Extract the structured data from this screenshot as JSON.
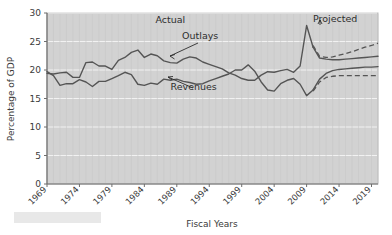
{
  "chart_data": {
    "type": "line",
    "title": "",
    "xlabel": "Fiscal Years",
    "ylabel": "Percentage of GDP",
    "xlim": [
      1969,
      2020
    ],
    "ylim": [
      0,
      30
    ],
    "grid": true,
    "legend_position": "inline-annotations",
    "x_tick_labels": [
      "1969",
      "1974",
      "1979",
      "1984",
      "1989",
      "1994",
      "1999",
      "2004",
      "2009",
      "2014",
      "2019"
    ],
    "y_tick_labels": [
      "0",
      "5",
      "10",
      "15",
      "20",
      "25",
      "30"
    ],
    "y_ticks": [
      0,
      5,
      10,
      15,
      20,
      25,
      30
    ],
    "annotations": [
      {
        "name": "actual-label",
        "text": "Actual",
        "x": 1988,
        "y": 28.2
      },
      {
        "name": "projected-label",
        "text": "Projected",
        "x": 2013.4,
        "y": 28.4
      },
      {
        "name": "outlays-label",
        "text": "Outlays",
        "x": 1992.6,
        "y": 25.4
      },
      {
        "name": "revenues-label",
        "text": "Revenues",
        "x": 1991.6,
        "y": 16.5
      }
    ],
    "series": [
      {
        "name": "Outlays",
        "style": "solid",
        "segment": "actual",
        "color": "#555555",
        "x": [
          1969,
          1970,
          1971,
          1972,
          1973,
          1974,
          1975,
          1976,
          1977,
          1978,
          1979,
          1980,
          1981,
          1982,
          1983,
          1984,
          1985,
          1986,
          1987,
          1988,
          1989,
          1990,
          1991,
          1992,
          1993,
          1994,
          1995,
          1996,
          1997,
          1998,
          1999,
          2000,
          2001,
          2002,
          2003,
          2004,
          2005,
          2006,
          2007,
          2008,
          2009,
          2010
        ],
        "values": [
          19.4,
          19.3,
          19.5,
          19.6,
          18.7,
          18.7,
          21.3,
          21.4,
          20.7,
          20.7,
          20.1,
          21.7,
          22.2,
          23.1,
          23.5,
          22.2,
          22.8,
          22.5,
          21.6,
          21.3,
          21.2,
          21.9,
          22.3,
          22.1,
          21.4,
          21.0,
          20.6,
          20.2,
          19.5,
          19.1,
          18.5,
          18.2,
          18.2,
          19.1,
          19.7,
          19.6,
          19.9,
          20.1,
          19.6,
          20.7,
          27.8,
          24.0
        ]
      },
      {
        "name": "Revenues",
        "style": "solid",
        "segment": "actual",
        "color": "#555555",
        "x": [
          1969,
          1970,
          1971,
          1972,
          1973,
          1974,
          1975,
          1976,
          1977,
          1978,
          1979,
          1980,
          1981,
          1982,
          1983,
          1984,
          1985,
          1986,
          1987,
          1988,
          1989,
          1990,
          1991,
          1992,
          1993,
          1994,
          1995,
          1996,
          1997,
          1998,
          1999,
          2000,
          2001,
          2002,
          2003,
          2004,
          2005,
          2006,
          2007,
          2008,
          2009,
          2010
        ],
        "values": [
          19.7,
          19.0,
          17.3,
          17.6,
          17.6,
          18.3,
          17.9,
          17.1,
          18.0,
          18.0,
          18.5,
          19.0,
          19.6,
          19.2,
          17.5,
          17.3,
          17.7,
          17.5,
          18.4,
          18.2,
          18.4,
          18.0,
          17.8,
          17.5,
          17.6,
          18.1,
          18.5,
          18.9,
          19.3,
          20.0,
          20.0,
          20.9,
          19.8,
          17.9,
          16.5,
          16.3,
          17.6,
          18.2,
          18.5,
          17.5,
          15.5,
          16.5
        ]
      },
      {
        "name": "Outlays (projected, baseline)",
        "style": "solid",
        "segment": "projected",
        "color": "#555555",
        "x": [
          2010,
          2011,
          2012,
          2013,
          2014,
          2015,
          2016,
          2017,
          2018,
          2019,
          2020
        ],
        "values": [
          24.0,
          22.1,
          21.9,
          21.8,
          21.8,
          21.9,
          22.0,
          22.1,
          22.2,
          22.3,
          22.4
        ]
      },
      {
        "name": "Outlays (projected, alternative)",
        "style": "dashed",
        "segment": "projected",
        "color": "#555555",
        "x": [
          2010,
          2011,
          2012,
          2013,
          2014,
          2015,
          2016,
          2017,
          2018,
          2019,
          2020
        ],
        "values": [
          24.3,
          22.4,
          22.2,
          22.3,
          22.6,
          22.9,
          23.2,
          23.6,
          24.0,
          24.3,
          24.7
        ]
      },
      {
        "name": "Revenues (projected, baseline)",
        "style": "solid",
        "segment": "projected",
        "color": "#555555",
        "x": [
          2010,
          2011,
          2012,
          2013,
          2014,
          2015,
          2016,
          2017,
          2018,
          2019,
          2020
        ],
        "values": [
          16.5,
          18.4,
          19.4,
          19.9,
          20.1,
          20.2,
          20.3,
          20.4,
          20.5,
          20.5,
          20.6
        ]
      },
      {
        "name": "Revenues (projected, alternative)",
        "style": "dashed",
        "segment": "projected",
        "color": "#555555",
        "x": [
          2010,
          2011,
          2012,
          2013,
          2014,
          2015,
          2016,
          2017,
          2018,
          2019,
          2020
        ],
        "values": [
          16.3,
          17.9,
          18.7,
          18.9,
          19.0,
          19.0,
          19.0,
          19.0,
          19.0,
          19.0,
          19.0
        ]
      }
    ],
    "colors": {
      "plot_background": "#d2d2d2",
      "page_background": "#ffffff",
      "line": "#555555",
      "gridline": "#f2f2f2",
      "text": "#333333",
      "footer_box": "#e8e8e8"
    }
  }
}
